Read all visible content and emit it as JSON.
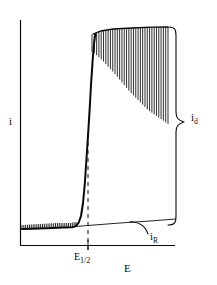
{
  "figure": {
    "kind": "polarogram",
    "background_color": "#ffffff",
    "ink_color": "#0a0a0a"
  },
  "axes": {
    "y_axis_label": "i",
    "x_axis_label": "E",
    "y_axis_name": "current",
    "x_axis_name": "potential",
    "origin_px": [
      20,
      245
    ],
    "y_axis_top_px": 20,
    "x_axis_right_px": 175,
    "ticks": {
      "x": [
        {
          "label_main": "E",
          "label_sub": "1/2",
          "position_px": 88
        }
      ],
      "y": []
    }
  },
  "annotations": {
    "diffusion_current": {
      "label_main": "i",
      "label_sub": "d",
      "brace_top_px": 27,
      "brace_bottom_px": 225,
      "brace_tip_px": 122
    },
    "residual_current": {
      "label_main": "i",
      "label_sub": "R",
      "leader_from_px": [
        150,
        234
      ],
      "leader_to_px": [
        128,
        222
      ]
    },
    "half_wave_potential": {
      "label_main": "E",
      "label_sub": "1/2",
      "dashed_line_x_px": 88,
      "dashed_line_top_px": 134,
      "dashed_line_bottom_px": 253
    }
  },
  "chart_data": {
    "type": "line",
    "title": "",
    "xlabel": "E",
    "ylabel": "i",
    "grid": false,
    "legend": false,
    "xlim": [
      20,
      175
    ],
    "ylim_px": [
      245,
      20
    ],
    "series": [
      {
        "name": "residual-baseline",
        "comment": "pre-wave flat region, slight upward slope, px coords",
        "points": [
          [
            22,
            229
          ],
          [
            40,
            228
          ],
          [
            58,
            227
          ],
          [
            70,
            227
          ],
          [
            75,
            226
          ]
        ]
      },
      {
        "name": "rising-wave",
        "comment": "sigmoidal rise through E_1/2, px coords",
        "points": [
          [
            75,
            226
          ],
          [
            79,
            222
          ],
          [
            82,
            212
          ],
          [
            84,
            196
          ],
          [
            86,
            170
          ],
          [
            88,
            140
          ],
          [
            90,
            104
          ],
          [
            92,
            70
          ],
          [
            94,
            44
          ],
          [
            96,
            33
          ]
        ]
      },
      {
        "name": "plateau-upper-envelope",
        "comment": "tops of drop oscillations on limiting plateau, px coords",
        "points": [
          [
            93,
            34
          ],
          [
            100,
            31
          ],
          [
            112,
            29
          ],
          [
            130,
            28
          ],
          [
            150,
            27
          ],
          [
            168,
            27
          ]
        ]
      },
      {
        "name": "plateau-lower-envelope",
        "comment": "bottoms of drop oscillations on limiting plateau, px coords",
        "points": [
          [
            93,
            52
          ],
          [
            102,
            60
          ],
          [
            115,
            74
          ],
          [
            130,
            92
          ],
          [
            148,
            110
          ],
          [
            168,
            124
          ]
        ]
      },
      {
        "name": "residual-current-line",
        "comment": "extrapolated residual current line i_R, px coords",
        "points": [
          [
            75,
            226
          ],
          [
            120,
            223
          ],
          [
            150,
            221
          ],
          [
            175,
            219
          ]
        ]
      }
    ],
    "oscillations": {
      "baseline": {
        "x_start_px": 22,
        "x_end_px": 76,
        "count": 30,
        "amplitude_px": 4
      },
      "plateau": {
        "x_start_px": 92,
        "x_end_px": 168,
        "count": 34
      }
    }
  }
}
